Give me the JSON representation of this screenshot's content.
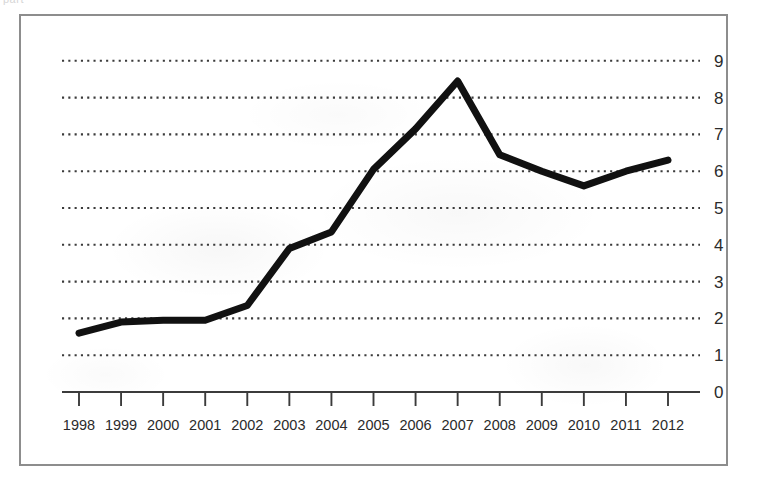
{
  "figure": {
    "scan_artifact_text": "part",
    "frame_color": "#8d8d8d",
    "background_color": "#ffffff"
  },
  "chart_data": {
    "type": "line",
    "title": "",
    "subtitle": "",
    "xlabel": "",
    "ylabel": "",
    "categories": [
      "1998",
      "1999",
      "2000",
      "2001",
      "2002",
      "2003",
      "2004",
      "2005",
      "2006",
      "2007",
      "2008",
      "2009",
      "2010",
      "2011",
      "2012"
    ],
    "x": [
      1998,
      1999,
      2000,
      2001,
      2002,
      2003,
      2004,
      2005,
      2006,
      2007,
      2008,
      2009,
      2010,
      2011,
      2012
    ],
    "values": [
      1.6,
      1.9,
      1.95,
      1.95,
      2.35,
      3.9,
      4.35,
      6.05,
      7.15,
      8.45,
      6.45,
      6.0,
      5.6,
      6.0,
      6.3
    ],
    "series": [
      {
        "name": "series-1",
        "color": "#111111",
        "line_width": 7,
        "values": [
          1.6,
          1.9,
          1.95,
          1.95,
          2.35,
          3.9,
          4.35,
          6.05,
          7.15,
          8.45,
          6.45,
          6.0,
          5.6,
          6.0,
          6.3
        ]
      }
    ],
    "ylim": [
      0,
      9
    ],
    "xlim": [
      1998,
      2012
    ],
    "ytick_labels": [
      "0",
      "1",
      "2",
      "3",
      "4",
      "5",
      "6",
      "7",
      "8",
      "9"
    ],
    "ytick_values": [
      0,
      1,
      2,
      3,
      4,
      5,
      6,
      7,
      8,
      9
    ],
    "ytick_position": "right",
    "xtick_position": "bottom",
    "grid": true,
    "grid_style": "dotted",
    "grid_axis": "y",
    "grid_color": "#3b3b3b",
    "legend": false,
    "legend_position": "none",
    "axis_line_color": "#3b3b3b",
    "annotations": []
  }
}
